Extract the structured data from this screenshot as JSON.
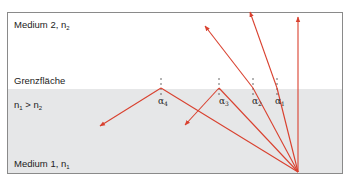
{
  "labels": {
    "medium2": "Medium 2, n",
    "medium2_sub": "2",
    "interface": "Grenzfläche",
    "condition_a": "n",
    "condition_a_sub": "1",
    "condition_op": " > n",
    "condition_b_sub": "2",
    "medium1": "Medium 1, n",
    "medium1_sub": "1"
  },
  "angles": [
    {
      "symbol": "α",
      "sub": "4"
    },
    {
      "symbol": "α",
      "sub": "3"
    },
    {
      "symbol": "α",
      "sub": "2"
    },
    {
      "symbol": "α",
      "sub": "1"
    }
  ],
  "colors": {
    "ray": "#d9412f",
    "medium1_fill": "#e6e7e8",
    "frame": "#8a8a8a"
  }
}
